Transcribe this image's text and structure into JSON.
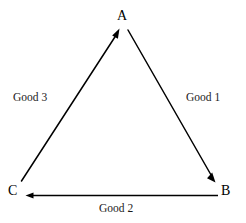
{
  "diagram": {
    "background_color": "#ffffff",
    "stroke_color": "#000000",
    "nodes": [
      {
        "id": "A",
        "label": "A",
        "position": "top"
      },
      {
        "id": "B",
        "label": "B",
        "position": "bottom-right"
      },
      {
        "id": "C",
        "label": "C",
        "position": "bottom-left"
      }
    ],
    "edges": [
      {
        "id": "good-1",
        "label": "Good 1",
        "from": "A",
        "to": "B",
        "side": "right",
        "arrowhead": "at-b-pointing-down-right"
      },
      {
        "id": "good-2",
        "label": "Good 2",
        "from": "B",
        "to": "C",
        "side": "bottom",
        "arrowhead": "at-c-pointing-left"
      },
      {
        "id": "good-3",
        "label": "Good 3",
        "from": "C",
        "to": "A",
        "side": "left",
        "arrowhead": "at-a-pointing-up-right"
      }
    ]
  }
}
